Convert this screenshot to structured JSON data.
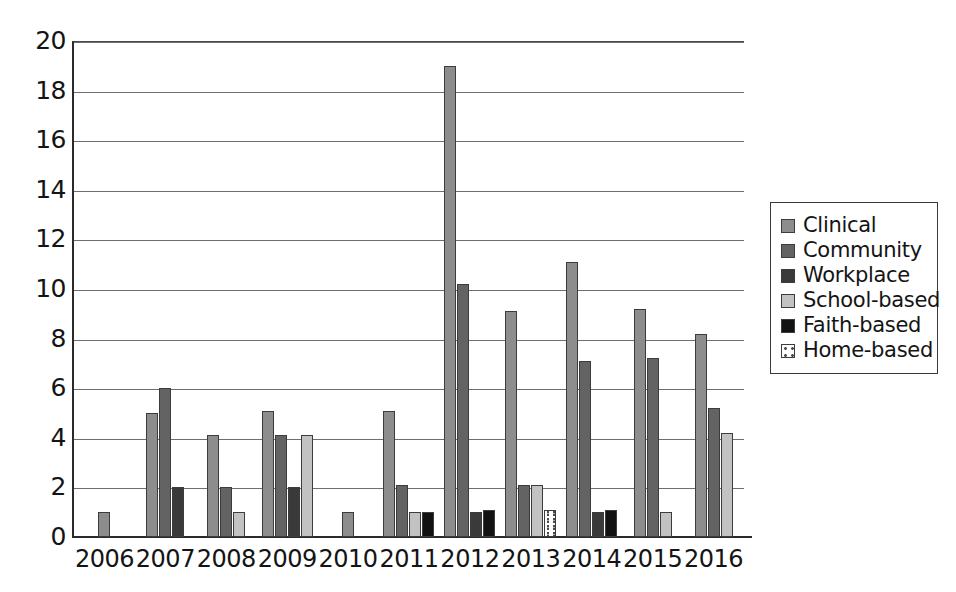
{
  "chart_data": {
    "type": "bar",
    "title": "",
    "subtitle": "",
    "xlabel": "",
    "ylabel": "",
    "grid": true,
    "legend_position": "right",
    "ylim": [
      0,
      20
    ],
    "ytick_step": 2,
    "ytick_labels": [
      "20",
      "18",
      "16",
      "14",
      "12",
      "10",
      "8",
      "6",
      "4",
      "2",
      "0"
    ],
    "ytick_values": [
      20,
      18,
      16,
      14,
      12,
      10,
      8,
      6,
      4,
      2,
      0
    ],
    "categories": [
      "2006",
      "2007",
      "2008",
      "2009",
      "2010",
      "2011",
      "2012",
      "2013",
      "2014",
      "2015",
      "2016"
    ],
    "series": [
      {
        "name": "Clinical",
        "color": "#8d8d8d",
        "values": [
          1,
          5,
          4.1,
          5.1,
          1,
          5.1,
          19,
          9.1,
          11.1,
          9.2,
          8.2
        ]
      },
      {
        "name": "Community",
        "color": "#636363",
        "values": [
          0,
          6,
          2,
          4.1,
          0,
          2.1,
          10.2,
          2.1,
          7.1,
          7.2,
          5.2
        ]
      },
      {
        "name": "Workplace",
        "color": "#3a3a3a",
        "values": [
          0,
          2,
          0,
          2,
          0,
          0,
          1,
          0,
          1,
          0,
          0
        ]
      },
      {
        "name": "School-based",
        "color": "#c2c2c2",
        "values": [
          0,
          0,
          1,
          4.1,
          0,
          1,
          0,
          2.1,
          0,
          1,
          4.2
        ]
      },
      {
        "name": "Faith-based",
        "color": "#121212",
        "values": [
          0,
          0,
          0,
          0,
          0,
          1,
          1.1,
          0,
          1.1,
          0,
          0
        ]
      },
      {
        "name": "Home-based",
        "color": "#fdfdfd",
        "values": [
          0,
          0,
          0,
          0,
          0,
          0,
          0,
          1.1,
          0,
          0,
          0
        ]
      }
    ]
  },
  "legend": {
    "items": [
      {
        "label": "Clinical",
        "swatch": "clinical"
      },
      {
        "label": "Community",
        "swatch": "community"
      },
      {
        "label": "Workplace",
        "swatch": "workplace"
      },
      {
        "label": "School-based",
        "swatch": "school"
      },
      {
        "label": "Faith-based",
        "swatch": "faith"
      },
      {
        "label": "Home-based",
        "swatch": "home"
      }
    ]
  }
}
